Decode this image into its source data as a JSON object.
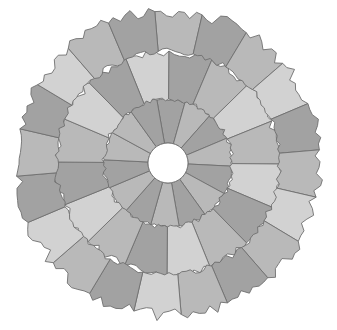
{
  "board": {
    "center": [
      168,
      163
    ],
    "hole_radius": 20,
    "outline_color": "#6f6f6f",
    "hole_color": "#ffffff",
    "shades": {
      "light": "#d2d2d2",
      "mid": "#b9b9b9",
      "dark": "#a2a2a2"
    }
  },
  "rings": [
    {
      "name": "inner",
      "r0": 20,
      "r1": 64,
      "jag": 2,
      "start_deg": -100,
      "shades": [
        "dark",
        "mid",
        "dark",
        "mid",
        "dark",
        "mid",
        "dark",
        "mid",
        "dark",
        "mid",
        "dark",
        "mid",
        "mid",
        "dark"
      ]
    },
    {
      "name": "middle",
      "r0": 64,
      "r1": 112,
      "jag": 5,
      "start_deg": -112,
      "shades": [
        "light",
        "dark",
        "mid",
        "light",
        "mid",
        "light",
        "dark",
        "mid",
        "light",
        "dark",
        "mid",
        "light",
        "dark",
        "mid",
        "light",
        "dark"
      ]
    },
    {
      "name": "outer",
      "r0": 112,
      "r1": 152,
      "jag": 6,
      "start_deg": -95,
      "shades": [
        "mid",
        "dark",
        "mid",
        "light",
        "dark",
        "mid",
        "light",
        "mid",
        "dark",
        "mid",
        "light",
        "dark",
        "mid",
        "light",
        "dark",
        "mid",
        "dark",
        "light",
        "mid",
        "dark"
      ]
    }
  ]
}
